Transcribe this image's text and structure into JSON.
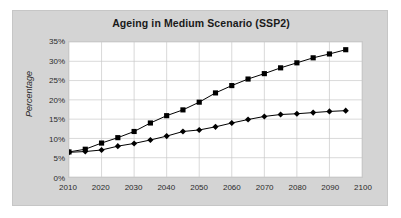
{
  "chart_data": {
    "type": "line",
    "title": "Ageing in Medium Scenario (SSP2)",
    "xlabel": "",
    "ylabel": "Percentage",
    "x": [
      2010,
      2015,
      2020,
      2025,
      2030,
      2035,
      2040,
      2045,
      2050,
      2055,
      2060,
      2065,
      2070,
      2075,
      2080,
      2085,
      2090,
      2095
    ],
    "xlim": [
      2010,
      2100
    ],
    "ylim": [
      0,
      35
    ],
    "xticks": [
      2010,
      2020,
      2030,
      2040,
      2050,
      2060,
      2070,
      2080,
      2090,
      2100
    ],
    "xtick_labels": [
      "2010",
      "2020",
      "2030",
      "2040",
      "2050",
      "2060",
      "2070",
      "2080",
      "2090",
      "2100"
    ],
    "yticks": [
      0,
      5,
      10,
      15,
      20,
      25,
      30,
      35
    ],
    "ytick_labels": [
      "0%",
      "5%",
      "10%",
      "15%",
      "20%",
      "25%",
      "30%",
      "35%"
    ],
    "grid": true,
    "grid_axis": "both",
    "legend": null,
    "legend_position": "none",
    "series": [
      {
        "name": "upper-series",
        "marker": "square",
        "color": "#000000",
        "values": [
          6.5,
          7.2,
          8.8,
          10.2,
          11.8,
          14.0,
          15.9,
          17.4,
          19.4,
          21.8,
          23.7,
          25.4,
          26.8,
          28.3,
          29.6,
          30.9,
          31.9,
          33.0
        ]
      },
      {
        "name": "lower-series",
        "marker": "diamond",
        "color": "#000000",
        "values": [
          6.4,
          6.6,
          7.0,
          8.0,
          8.7,
          9.6,
          10.6,
          11.8,
          12.2,
          13.0,
          14.0,
          14.9,
          15.7,
          16.2,
          16.4,
          16.7,
          17.0,
          17.2
        ]
      }
    ]
  },
  "style": {
    "chart_area_background": "#d4d4d4",
    "plot_background": "#ffffff",
    "gridline_color": "#c9c9c9",
    "axis_text_color": "#2b2b2b",
    "title_color": "#1a1a1a"
  }
}
